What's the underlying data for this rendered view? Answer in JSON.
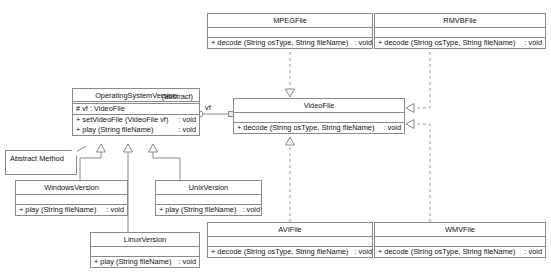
{
  "canvas": {
    "width": 551,
    "height": 272,
    "background": "#ffffff"
  },
  "colors": {
    "line": "#8a8a8a",
    "text": "#111111",
    "fill": "#ffffff",
    "dashed": "#9b9b9b"
  },
  "top_cut_text": "",
  "note": {
    "label": "Abstract Method"
  },
  "edge_labels": {
    "vf": "vf"
  },
  "classes": {
    "mpegfile": {
      "name": "MPEGFile",
      "stereotype": "",
      "attributes": [],
      "operations": [
        {
          "signature": "+ decode (String osType, String fileName)",
          "returns": ": void"
        }
      ]
    },
    "rmvbfile": {
      "name": "RMVBFile",
      "stereotype": "",
      "attributes": [],
      "operations": [
        {
          "signature": "+ decode (String osType, String fileName)",
          "returns": ": void"
        }
      ]
    },
    "videofile": {
      "name": "VideoFile",
      "stereotype": "interface-marker",
      "attributes": [],
      "operations": [
        {
          "signature": "+ decode (String osType, String fileName)",
          "returns": ": void"
        }
      ]
    },
    "operatingsystemversion": {
      "name": "OperatingSystemVersion",
      "subtitle": "(abstract)",
      "attributes": [
        {
          "text": "# vf : VideoFile"
        }
      ],
      "operations": [
        {
          "signature": "+ setVideoFile (VideoFile vf)",
          "returns": ": void"
        },
        {
          "signature": "+ play (String fileName)",
          "returns": ": void"
        }
      ]
    },
    "windowsversion": {
      "name": "WindowsVersion",
      "attributes": [],
      "operations": [
        {
          "signature": "+ play (String fileName)",
          "returns": ": void"
        }
      ]
    },
    "unixversion": {
      "name": "UnixVersion",
      "attributes": [],
      "operations": [
        {
          "signature": "+ play (String fileName)",
          "returns": ": void"
        }
      ]
    },
    "linuxversion": {
      "name": "LinuxVersion",
      "attributes": [],
      "operations": [
        {
          "signature": "+ play (String fileName)",
          "returns": ": void"
        }
      ]
    },
    "avifile": {
      "name": "AVIFile",
      "attributes": [],
      "operations": [
        {
          "signature": "+ decode (String osType, String fileName)",
          "returns": ": void"
        }
      ]
    },
    "wmvfile": {
      "name": "WMVFile",
      "attributes": [],
      "operations": [
        {
          "signature": "+ decode (String osType, String fileName)",
          "returns": ": void"
        }
      ]
    }
  },
  "relationships": [
    {
      "from": "mpegfile",
      "to": "videofile",
      "type": "realization"
    },
    {
      "from": "rmvbfile",
      "to": "videofile",
      "type": "realization"
    },
    {
      "from": "avifile",
      "to": "videofile",
      "type": "realization"
    },
    {
      "from": "wmvfile",
      "to": "videofile",
      "type": "realization"
    },
    {
      "from": "operatingsystemversion",
      "to": "videofile",
      "type": "association",
      "label": "vf"
    },
    {
      "from": "windowsversion",
      "to": "operatingsystemversion",
      "type": "generalization"
    },
    {
      "from": "unixversion",
      "to": "operatingsystemversion",
      "type": "generalization"
    },
    {
      "from": "linuxversion",
      "to": "operatingsystemversion",
      "type": "generalization"
    },
    {
      "from": "note",
      "to": "operatingsystemversion",
      "type": "anchor"
    }
  ]
}
